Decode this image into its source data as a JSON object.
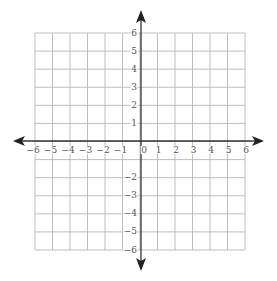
{
  "diagram": {
    "type": "coordinate-plane",
    "x_range": [
      -6,
      6
    ],
    "y_range": [
      -6,
      6
    ],
    "grid_step": 1,
    "x_tick_labels": [
      "−6",
      "−5",
      "−4",
      "−3",
      "−2",
      "−1",
      "0",
      "1",
      "2",
      "3",
      "4",
      "5",
      "6"
    ],
    "y_tick_labels_positive": [
      "6",
      "5",
      "4",
      "3",
      "2",
      "1"
    ],
    "y_tick_labels_negative": [
      "−2",
      "−3",
      "−4",
      "−5",
      "−6"
    ],
    "colors": {
      "grid": "#b8b8b8",
      "axis": "#333333",
      "label": "#555555",
      "background": "#ffffff"
    }
  }
}
